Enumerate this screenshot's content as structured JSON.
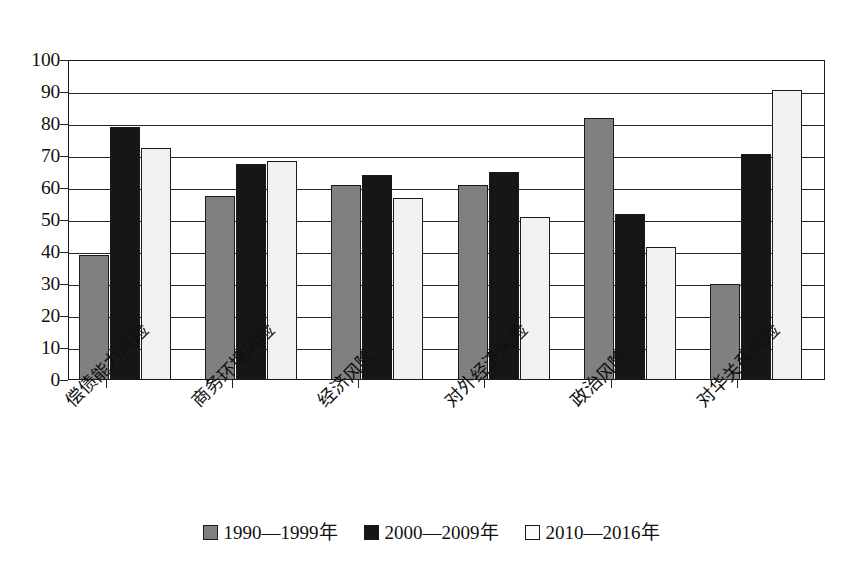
{
  "chart_data": {
    "type": "bar",
    "title": "",
    "subtitle": "",
    "xlabel": "",
    "ylabel": "",
    "ylim": [
      0,
      100
    ],
    "ytick_step": 10,
    "grid": true,
    "legend_position": "bottom",
    "orientation": "vertical",
    "grouping": "clustered",
    "categories": [
      "偿债能力风险",
      "商务环境风险",
      "经济风险",
      "对外经济风险",
      "政治风险",
      "对华关系风险"
    ],
    "ytick_labels": [
      "0",
      "10",
      "20",
      "30",
      "40",
      "50",
      "60",
      "70",
      "80",
      "90",
      "100"
    ],
    "series": [
      {
        "name": "1990—1999年",
        "color": "#808080",
        "values": [
          39,
          57.5,
          61,
          61,
          82,
          30
        ]
      },
      {
        "name": "2000—2009年",
        "color": "#161616",
        "values": [
          79,
          67.5,
          64,
          65,
          52,
          70.5
        ]
      },
      {
        "name": "2010—2016年",
        "color": "#f1f1f1",
        "values": [
          72.5,
          68.5,
          57,
          51,
          41.5,
          90.5
        ]
      }
    ]
  },
  "legend": {
    "items": [
      {
        "label": "1990—1999年",
        "swatch": "gray-swatch"
      },
      {
        "label": "2000—2009年",
        "swatch": "black-swatch"
      },
      {
        "label": "2010—2016年",
        "swatch": "white-swatch"
      }
    ]
  },
  "colors": {
    "series_1": "#808080",
    "series_2": "#161616",
    "series_3": "#f1f1f1",
    "axis": "#262626",
    "background": "#ffffff",
    "text": "#111111"
  }
}
